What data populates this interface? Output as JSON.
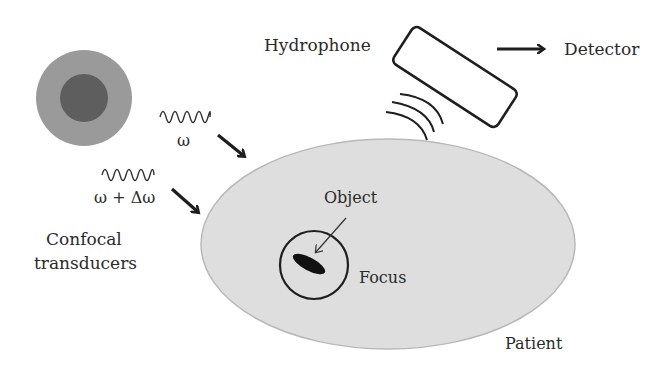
{
  "diagram": {
    "labels": {
      "hydrophone": "Hydrophone",
      "detector": "Detector",
      "omega": "ω",
      "omega_delta": "ω + Δω",
      "confocal_line1": "Confocal",
      "confocal_line2": "transducers",
      "object": "Object",
      "focus": "Focus",
      "patient": "Patient"
    },
    "colors": {
      "transducer_outer": "#9a9a9a",
      "transducer_inner": "#5e5e5e",
      "patient_fill": "#dedede",
      "patient_edge": "#b8b8b8",
      "stroke": "#1e1e1e",
      "object": "#111111"
    }
  }
}
